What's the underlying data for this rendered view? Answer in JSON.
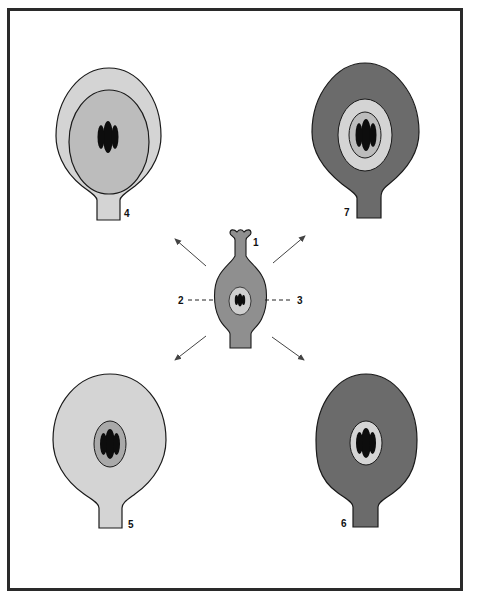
{
  "diagram": {
    "colors": {
      "outline": "#1a1a1a",
      "light": "#d4d4d4",
      "medium": "#a9a9a9",
      "dark": "#6b6b6b",
      "nucleus": "#0d0d0d",
      "arrow": "#444444"
    },
    "center": {
      "label_1": "1",
      "label_2": "2",
      "label_3": "3"
    },
    "panels": [
      {
        "id": "4",
        "label": "4"
      },
      {
        "id": "7",
        "label": "7"
      },
      {
        "id": "5",
        "label": "5"
      },
      {
        "id": "6",
        "label": "6"
      }
    ]
  }
}
